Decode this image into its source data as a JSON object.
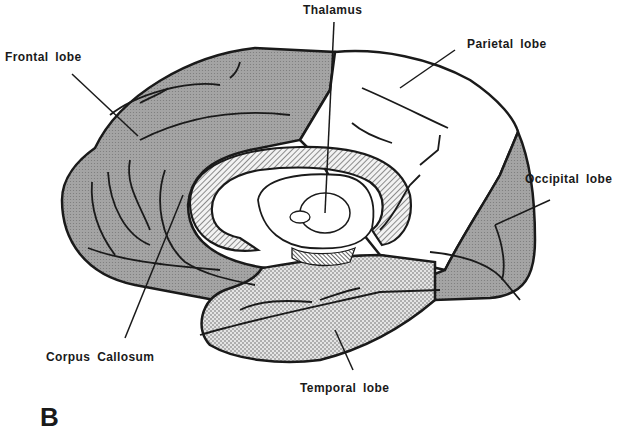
{
  "figure": {
    "panel_letter": "B",
    "labels": {
      "frontal": "Frontal lobe",
      "thalamus": "Thalamus",
      "parietal": "Parietal lobe",
      "occipital": "Occipital lobe",
      "corpus_callosum": "Corpus Callosum",
      "temporal": "Temporal lobe"
    },
    "colors": {
      "outline": "#1a1a1a",
      "frontal_fill": "#9e9e9e",
      "occipital_fill": "#9e9e9e",
      "parietal_fill": "#ffffff",
      "temporal_fill": "#d6d6d6",
      "corpus_callosum_fill": "#c8c8c8"
    }
  }
}
